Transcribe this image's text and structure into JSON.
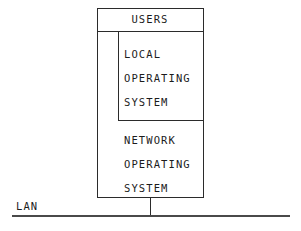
{
  "diagram": {
    "title_block": {
      "label": "USERS"
    },
    "local_block": {
      "lines": [
        "LOCAL",
        "OPERATING",
        "SYSTEM"
      ]
    },
    "network_block": {
      "lines": [
        "NETWORK",
        "OPERATING",
        "SYSTEM"
      ]
    },
    "bus": {
      "label": "LAN"
    },
    "colors": {
      "background": "#ffffff",
      "stroke": "#2b2b2b",
      "bus_stroke": "#4a4a4a",
      "text": "#1c1c1c"
    }
  }
}
